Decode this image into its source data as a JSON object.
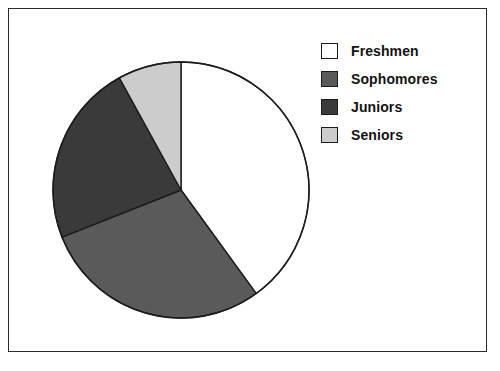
{
  "figure": {
    "background_color": "#ffffff",
    "frame_color": "#2b2b2b"
  },
  "legend": {
    "position": "right",
    "entries": [
      {
        "label": "Freshmen",
        "color": "#ffffff",
        "swatch_name": "legend-swatch-freshmen"
      },
      {
        "label": "Sophomores",
        "color": "#5a5a5a",
        "swatch_name": "legend-swatch-sophomores"
      },
      {
        "label": "Juniors",
        "color": "#3a3a3a",
        "swatch_name": "legend-swatch-juniors"
      },
      {
        "label": "Seniors",
        "color": "#cccccc",
        "swatch_name": "legend-swatch-seniors"
      }
    ]
  },
  "chart_data": {
    "type": "pie",
    "title": "",
    "subtitle": "",
    "xlabel": "",
    "ylabel": "",
    "grid": false,
    "legend_position": "right",
    "start_angle_deg": 0,
    "direction": "clockwise",
    "center_x": 136,
    "center_y": 136,
    "radius": 128,
    "slice_edge_color": "#1c1c1c",
    "categories": [
      "Freshmen",
      "Sophomores",
      "Juniors",
      "Seniors"
    ],
    "values": [
      40,
      29,
      23,
      8
    ],
    "value_unit": "percent",
    "angles_deg": [
      144,
      104.4,
      82.8,
      28.8
    ],
    "colors": [
      "#ffffff",
      "#5a5a5a",
      "#3a3a3a",
      "#cccccc"
    ],
    "annotations": []
  }
}
